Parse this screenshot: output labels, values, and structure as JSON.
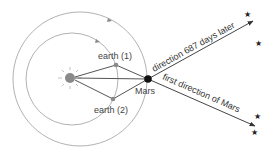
{
  "diagram": {
    "labels": {
      "earth1": "earth (1)",
      "earth2": "earth (2)",
      "mars": "Mars",
      "direction_later": "direction 687 days later",
      "first_direction": "first direction of Mars"
    },
    "stars": [
      "★",
      "★",
      "★",
      "★"
    ],
    "colors": {
      "orbit": "#9a9a9a",
      "line": "#555555",
      "sun": "#888888",
      "mars": "#111111",
      "earth": "#8a8a8a"
    }
  }
}
